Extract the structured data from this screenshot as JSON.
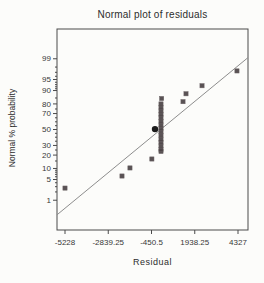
{
  "chart_data": {
    "type": "scatter",
    "subtype": "normal-probability-plot",
    "title": "Normal plot of residuals",
    "xlabel": "Residual",
    "ylabel": "Normal % probability",
    "x_ticks": [
      -5228,
      -2839.25,
      -450.5,
      1938.25,
      4327
    ],
    "y_ticks": [
      99,
      95,
      90,
      80,
      70,
      50,
      30,
      20,
      10,
      5,
      1
    ],
    "y_minor_ticks": [
      2,
      3,
      4,
      6,
      7,
      8,
      9,
      15,
      25,
      35,
      40,
      45,
      55,
      60,
      65,
      75,
      85,
      91,
      92,
      93,
      94,
      96,
      97,
      98
    ],
    "xlim": [
      -5228,
      4327
    ],
    "y_scale": "normal-probability",
    "grid": false,
    "legend": null,
    "points": [
      {
        "residual": -5228,
        "probability": 2.7
      },
      {
        "residual": -2080,
        "probability": 6.3
      },
      {
        "residual": -1640,
        "probability": 10.3
      },
      {
        "residual": -430,
        "probability": 16.6
      },
      {
        "residual": 74,
        "probability": 23.5
      },
      {
        "residual": 74,
        "probability": 25.5
      },
      {
        "residual": 74,
        "probability": 29.5
      },
      {
        "residual": 74,
        "probability": 33.5
      },
      {
        "residual": 74,
        "probability": 37.5
      },
      {
        "residual": 74,
        "probability": 42
      },
      {
        "residual": 74,
        "probability": 47
      },
      {
        "residual": 74,
        "probability": 51.5
      },
      {
        "residual": 74,
        "probability": 56
      },
      {
        "residual": 74,
        "probability": 60.5
      },
      {
        "residual": 74,
        "probability": 65
      },
      {
        "residual": 74,
        "probability": 69
      },
      {
        "residual": 74,
        "probability": 73
      },
      {
        "residual": 74,
        "probability": 76.5
      },
      {
        "residual": 74,
        "probability": 80
      },
      {
        "residual": 110,
        "probability": 84.6
      },
      {
        "residual": 1290,
        "probability": 82
      },
      {
        "residual": 1455,
        "probability": 88
      },
      {
        "residual": 2340,
        "probability": 92.5
      },
      {
        "residual": 4270,
        "probability": 97.3
      }
    ],
    "highlight_point": {
      "residual": -257,
      "probability": 50.5
    },
    "trend_line": {
      "from": {
        "residual": -5670,
        "probability": 0.25
      },
      "to": {
        "residual": 4880,
        "probability": 99.1
      }
    },
    "colors": {
      "marker": "#4b4345",
      "highlight_marker": "#1b1b1b",
      "trend_line": "#8d8d8d",
      "axis": "#4a4a4a",
      "text": "#383838",
      "background": "#fcfcfa"
    }
  }
}
